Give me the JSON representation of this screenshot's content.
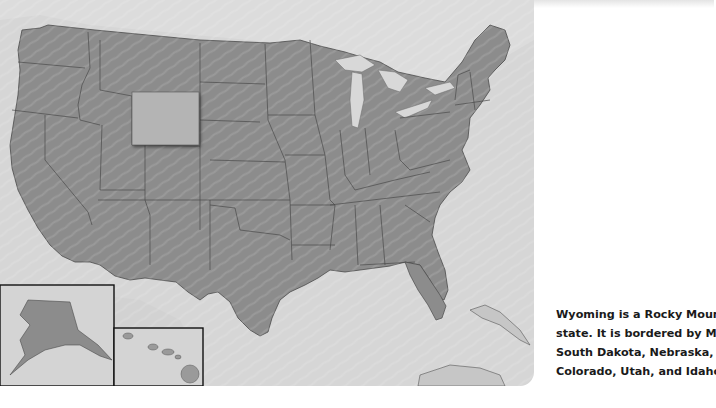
{
  "map": {
    "title": "United States",
    "highlighted_state": "Wyoming",
    "colors": {
      "background": "#d6d6d6",
      "land_other": "#d0d0d0",
      "states": "#8c8c8c",
      "highlight": "#b4b4b4",
      "borders": "#4a4a4a",
      "inset_border": "#111111",
      "lakes": "#d8d8d8"
    },
    "insets": [
      {
        "name": "Alaska"
      },
      {
        "name": "Hawaii"
      }
    ]
  },
  "caption": {
    "lines": [
      "Wyoming is a Rocky Mountain",
      "state. It is bordered by Montan",
      "South Dakota, Nebraska,",
      "Colorado, Utah, and Idaho."
    ],
    "text": "Wyoming is a Rocky Mountain state. It is bordered by Montana, South Dakota, Nebraska, Colorado, Utah, and Idaho."
  }
}
